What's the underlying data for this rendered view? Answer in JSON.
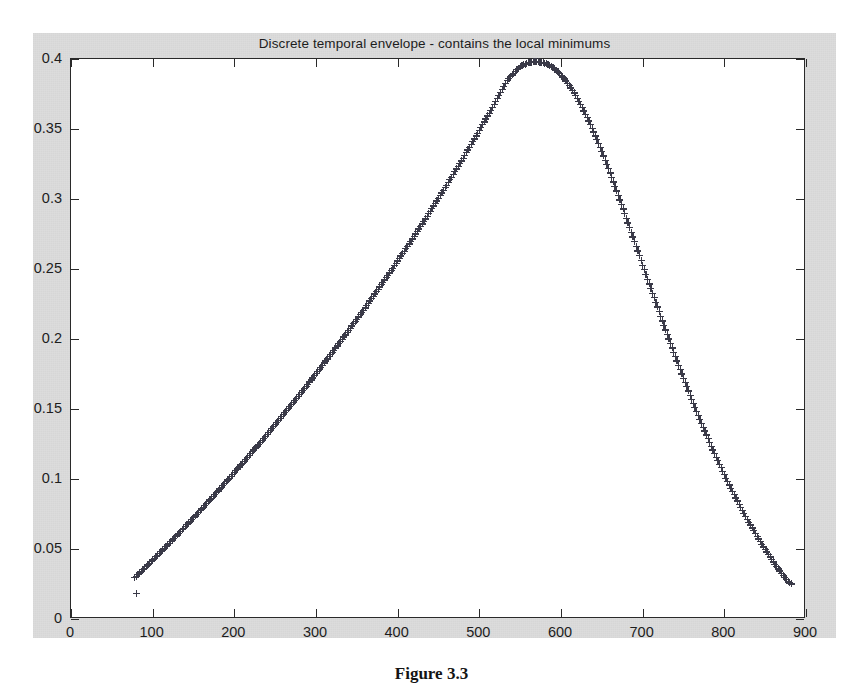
{
  "figure": {
    "caption": "Figure 3.3",
    "background_color": "#dcdcdc",
    "axes_background_color": "#ffffff",
    "axes_line_color": "#2a2a2a",
    "marker_color": "#3a3a48"
  },
  "chart_data": {
    "type": "scatter",
    "title": "Discrete temporal envelope - contains the local minimums",
    "xlabel": "",
    "ylabel": "",
    "xlim": [
      0,
      900
    ],
    "ylim": [
      0,
      0.4
    ],
    "xticks": [
      0,
      100,
      200,
      300,
      400,
      500,
      600,
      700,
      800,
      900
    ],
    "xticklabels": [
      "0",
      "100",
      "200",
      "300",
      "400",
      "500",
      "600",
      "700",
      "800",
      "900"
    ],
    "yticks": [
      0,
      0.05,
      0.1,
      0.15,
      0.2,
      0.25,
      0.3,
      0.35,
      0.4
    ],
    "yticklabels": [
      "0",
      "0.05",
      "0.1",
      "0.15",
      "0.2",
      "0.25",
      "0.3",
      "0.35",
      "0.4"
    ],
    "grid": false,
    "legend": null,
    "marker": "+",
    "series": [
      {
        "name": "discrete temporal envelope",
        "marker": "+",
        "x": [
          78,
          82,
          86,
          90,
          94,
          98,
          102,
          106,
          110,
          114,
          118,
          122,
          126,
          130,
          134,
          138,
          142,
          146,
          150,
          154,
          158,
          162,
          166,
          170,
          174,
          178,
          182,
          186,
          190,
          194,
          198,
          202,
          206,
          210,
          214,
          218,
          222,
          226,
          230,
          234,
          238,
          242,
          246,
          250,
          254,
          258,
          262,
          266,
          270,
          274,
          278,
          282,
          286,
          290,
          294,
          298,
          302,
          306,
          310,
          314,
          318,
          322,
          326,
          330,
          334,
          338,
          342,
          346,
          350,
          354,
          358,
          362,
          366,
          370,
          374,
          378,
          382,
          386,
          390,
          394,
          398,
          402,
          406,
          410,
          414,
          418,
          422,
          426,
          430,
          434,
          438,
          442,
          446,
          450,
          454,
          458,
          462,
          466,
          470,
          474,
          478,
          482,
          486,
          490,
          494,
          498,
          502,
          506,
          510,
          514,
          518,
          522,
          526,
          530,
          534,
          538,
          542,
          546,
          550,
          554,
          558,
          562,
          566,
          570,
          574,
          578,
          582,
          586,
          590,
          594,
          598,
          602,
          606,
          610,
          614,
          618,
          622,
          626,
          630,
          634,
          638,
          642,
          646,
          650,
          654,
          658,
          662,
          666,
          670,
          674,
          678,
          682,
          686,
          690,
          694,
          698,
          702,
          706,
          710,
          714,
          718,
          722,
          726,
          730,
          734,
          738,
          742,
          746,
          750,
          754,
          758,
          762,
          766,
          770,
          774,
          778,
          782,
          786,
          790,
          794,
          798,
          802,
          806,
          810,
          814,
          818,
          822,
          826,
          830,
          834,
          838,
          842,
          846,
          850,
          854,
          858,
          862,
          866,
          870,
          874,
          878,
          882
        ],
        "y": [
          0.0295,
          0.0318,
          0.0341,
          0.0364,
          0.0387,
          0.041,
          0.0434,
          0.0457,
          0.0481,
          0.0505,
          0.0529,
          0.0553,
          0.0577,
          0.0601,
          0.0626,
          0.065,
          0.0675,
          0.07,
          0.0725,
          0.075,
          0.0775,
          0.08,
          0.0826,
          0.0851,
          0.0877,
          0.0903,
          0.0929,
          0.0955,
          0.0981,
          0.1007,
          0.1034,
          0.106,
          0.1087,
          0.1114,
          0.1141,
          0.1168,
          0.1195,
          0.1222,
          0.125,
          0.1277,
          0.1305,
          0.1333,
          0.1361,
          0.1389,
          0.1417,
          0.1446,
          0.1474,
          0.1503,
          0.1532,
          0.1561,
          0.159,
          0.1619,
          0.1649,
          0.1678,
          0.1708,
          0.1738,
          0.1768,
          0.1798,
          0.1829,
          0.1859,
          0.189,
          0.1921,
          0.1952,
          0.1983,
          0.2015,
          0.2046,
          0.2078,
          0.211,
          0.2142,
          0.2174,
          0.2207,
          0.2239,
          0.2272,
          0.2305,
          0.2338,
          0.2372,
          0.2405,
          0.2439,
          0.2473,
          0.2507,
          0.2541,
          0.2576,
          0.261,
          0.2645,
          0.268,
          0.2716,
          0.2751,
          0.2787,
          0.2823,
          0.2859,
          0.2895,
          0.2932,
          0.2969,
          0.3006,
          0.3043,
          0.3081,
          0.3119,
          0.3157,
          0.3195,
          0.3234,
          0.3272,
          0.3312,
          0.3351,
          0.3391,
          0.343,
          0.3471,
          0.3511,
          0.3552,
          0.3593,
          0.3634,
          0.3676,
          0.3718,
          0.376,
          0.3803,
          0.3846,
          0.3876,
          0.3896,
          0.3925,
          0.3944,
          0.3958,
          0.3968,
          0.3975,
          0.3979,
          0.398,
          0.3978,
          0.3973,
          0.3965,
          0.3953,
          0.3938,
          0.392,
          0.3898,
          0.3873,
          0.3844,
          0.3812,
          0.3777,
          0.3739,
          0.3698,
          0.3654,
          0.3607,
          0.3558,
          0.3506,
          0.3452,
          0.3396,
          0.3338,
          0.3278,
          0.3217,
          0.3155,
          0.3091,
          0.3027,
          0.2962,
          0.2896,
          0.283,
          0.2763,
          0.2696,
          0.2629,
          0.2562,
          0.2495,
          0.2428,
          0.2361,
          0.2295,
          0.2229,
          0.2163,
          0.2098,
          0.2033,
          0.1969,
          0.1906,
          0.1843,
          0.1781,
          0.172,
          0.166,
          0.16,
          0.1542,
          0.1484,
          0.1427,
          0.1371,
          0.1316,
          0.1262,
          0.1209,
          0.1157,
          0.1106,
          0.1056,
          0.1007,
          0.0959,
          0.0912,
          0.0866,
          0.0821,
          0.0777,
          0.0734,
          0.0692,
          0.0651,
          0.0611,
          0.0572,
          0.0534,
          0.0497,
          0.0461,
          0.0426,
          0.0392,
          0.0359,
          0.0327,
          0.0296,
          0.0266,
          0.0252
        ]
      },
      {
        "name": "isolated local minimum",
        "marker": "+",
        "x": [
          80
        ],
        "y": [
          0.0185
        ]
      }
    ]
  }
}
